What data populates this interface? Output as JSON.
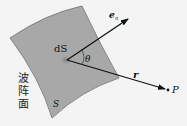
{
  "diagram": {
    "title": "",
    "labels": {
      "surface_element": "dS",
      "normal_vector": "e",
      "normal_subscript": "n",
      "angle": "θ",
      "position_vector": "r",
      "point": "P",
      "surface": "S",
      "wavefront_line1": "波",
      "wavefront_line2": "阵",
      "wavefront_line3": "面"
    },
    "colors": {
      "surface_fill": "#a6a6a6",
      "surface_stroke": "#6a6a6a",
      "element_spot": "#888888",
      "arrow": "#111111",
      "background": "#f4f4f4"
    }
  }
}
